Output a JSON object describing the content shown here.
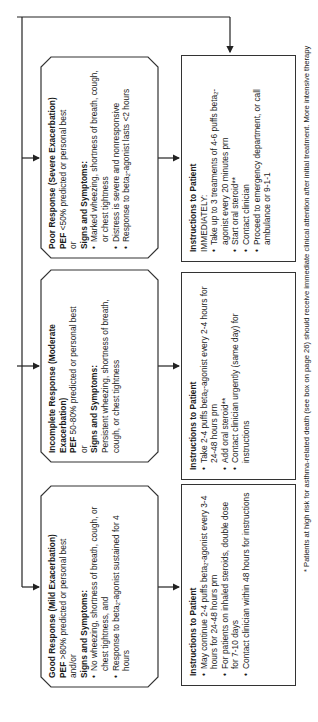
{
  "diagram": {
    "orientation": "rotated -90deg (landscape page)",
    "response_boxes": [
      {
        "id": "good",
        "title": "Good Response (Mild Exacerbation)",
        "pef_label": "PEF",
        "pef_text": ">80% predicted or personal best",
        "connector": "and/or",
        "signs_label": "Signs and Symptoms:",
        "items": [
          "No wheezing, shortness of breath, cough, or chest tightness, and",
          "Response to beta2-agonist sustained for 4 hours"
        ]
      },
      {
        "id": "moderate",
        "title": "Incomplete Response (Moderate Exacerbation)",
        "pef_label": "PEF",
        "pef_text": "50-80% predicted or personal best",
        "connector": "or",
        "signs_label": "Signs and Symptoms:",
        "text": "Persistent wheezing, shortness of breath, cough, or chest tightness"
      },
      {
        "id": "poor",
        "title": "Poor Response (Severe Exacerbation)",
        "pef_label": "PEF",
        "pef_text": "<50% predicted or personal best",
        "connector": "or",
        "signs_label": "Signs and Symptoms:",
        "items": [
          "Marked wheezing, shortness of breath, cough, or chest tightness",
          "Distress is severe and nonresponsive",
          "Response to beta2-agonist lasts <2 hours"
        ]
      }
    ],
    "instruction_boxes": [
      {
        "id": "good",
        "title": "Instructions to Patient",
        "items": [
          "May continue 2-4 puffs beta2-agonist every 3-4 hours for 24-48 hours prn",
          "For patients on inhaled steroids, double dose for 7-10 days",
          "Contact clinician within 48 hours for instructions"
        ]
      },
      {
        "id": "moderate",
        "title": "Instructions to Patient",
        "items": [
          "Take 2-4 puffs beta2-agonist every 2-4 hours for 24-48 hours prn",
          "Add oral steroid**",
          "Contact clinician urgently (same day) for instructions"
        ]
      },
      {
        "id": "poor",
        "title": "Instructions to Patient",
        "subtitle": "IMMEDIATELY:",
        "items": [
          "Take up to 3 treatments of 4-6 puffs beta2-agonist every 20 minutes prn",
          "Start oral steroid**",
          "Contact clinician",
          "Proceed to emergency department, or call ambulance or 9-1-1"
        ]
      }
    ],
    "footnote": "* Patients at high risk for asthma-related death (see box on page 26) should receive immediate clinical attention after initial treatment.  More intensive therapy"
  }
}
